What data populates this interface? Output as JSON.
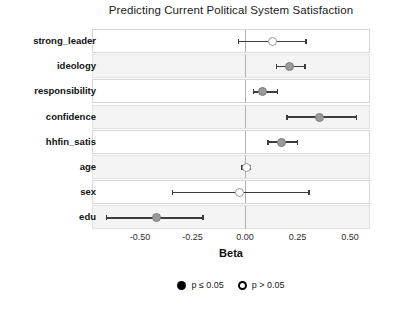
{
  "chart_data": {
    "type": "scatter",
    "plot_style": "coefficient-forest-plot",
    "title": "Predicting Current Political System Satisfaction",
    "xlabel": "Beta",
    "ylabel": "",
    "xlim": [
      -0.65,
      0.56
    ],
    "xticks": [
      -0.5,
      -0.25,
      0.0,
      0.25,
      0.5
    ],
    "xtick_labels": [
      "-0.50",
      "-0.25",
      "0.00",
      "0.25",
      "0.50"
    ],
    "grid": false,
    "zero_reference_line": 0.0,
    "legend_position": "bottom",
    "legend": [
      {
        "key": "significant",
        "label": "p ≤ 0.05",
        "marker": "filled-circle"
      },
      {
        "key": "not_significant",
        "label": "p > 0.05",
        "marker": "hollow-circle"
      }
    ],
    "categories": [
      "strong_leader",
      "ideology",
      "responsibility",
      "confidence",
      "hhfin_satis",
      "age",
      "sex",
      "edu"
    ],
    "points": [
      {
        "term": "strong_leader",
        "beta": 0.13,
        "ci_low": -0.03,
        "ci_high": 0.29,
        "significant": false
      },
      {
        "term": "ideology",
        "beta": 0.21,
        "ci_low": 0.15,
        "ci_high": 0.285,
        "significant": true
      },
      {
        "term": "responsibility",
        "beta": 0.085,
        "ci_low": 0.04,
        "ci_high": 0.155,
        "significant": true
      },
      {
        "term": "confidence",
        "beta": 0.355,
        "ci_low": 0.2,
        "ci_high": 0.53,
        "significant": true
      },
      {
        "term": "hhfin_satis",
        "beta": 0.175,
        "ci_low": 0.11,
        "ci_high": 0.25,
        "significant": true
      },
      {
        "term": "age",
        "beta": 0.005,
        "ci_low": -0.015,
        "ci_high": 0.025,
        "significant": false
      },
      {
        "term": "sex",
        "beta": -0.025,
        "ci_low": -0.345,
        "ci_high": 0.305,
        "significant": false
      },
      {
        "term": "edu",
        "beta": -0.42,
        "ci_low": -0.66,
        "ci_high": -0.2,
        "significant": true
      }
    ]
  },
  "colors": {
    "significant_marker": "#9a9a9a",
    "nonsignificant_marker": "#ffffff",
    "marker_outline": "#7d7d7d",
    "whisker": "#3c3c3c",
    "zero_line": "#b0b0b0",
    "panel_border": "#d6d6d6",
    "panel_alt_background": "#f4f4f4",
    "background": "#ffffff"
  }
}
